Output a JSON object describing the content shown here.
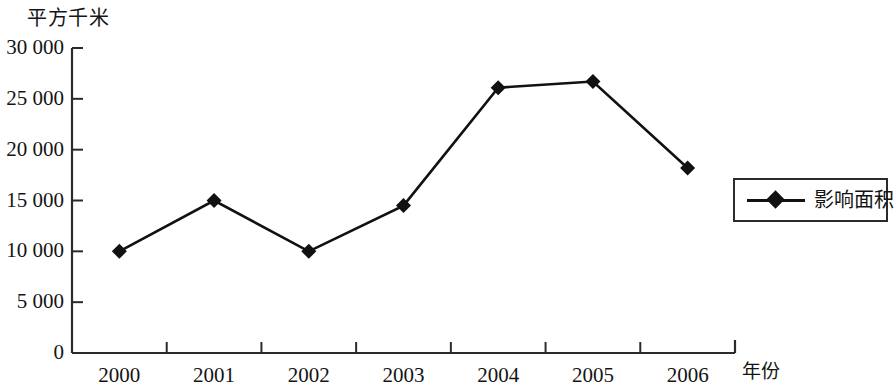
{
  "chart_data": {
    "type": "line",
    "title": "",
    "subtitle": "",
    "xlabel": "年份",
    "ylabel": "平方千米",
    "categories": [
      "2000",
      "2001",
      "2002",
      "2003",
      "2004",
      "2005",
      "2006"
    ],
    "series": [
      {
        "name": "影响面积",
        "values": [
          10000,
          15000,
          10000,
          14500,
          26100,
          26700,
          18200
        ],
        "marker": "diamond",
        "color": "#111111"
      }
    ],
    "ylim": [
      0,
      30000
    ],
    "y_ticks": [
      0,
      5000,
      10000,
      15000,
      20000,
      25000,
      30000
    ],
    "y_tick_labels": [
      "0",
      "5 000",
      "10 000",
      "15 000",
      "20 000",
      "25 000",
      "30 000"
    ],
    "grid": false,
    "legend_position": "right"
  },
  "legend": {
    "entries": [
      {
        "label": "影响面积",
        "marker_icon": "diamond-marker-icon",
        "color": "#111111"
      }
    ]
  },
  "axis": {
    "y_unit": "平方千米",
    "x_unit": "年份"
  }
}
